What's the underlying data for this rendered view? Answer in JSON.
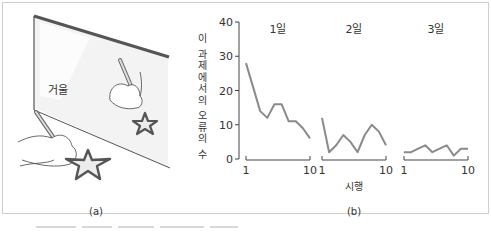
{
  "illustration": {
    "mirror_label": "거울",
    "panel_label": "(a)"
  },
  "chart_data": {
    "type": "line",
    "title": "",
    "ylabel": "이 과제에서의 오류의 수",
    "xlabel": "시행",
    "panel_label": "(b)",
    "ylim": [
      0,
      40
    ],
    "yticks": [
      0,
      10,
      20,
      30,
      40
    ],
    "grid": false,
    "line_color": "#8a8a8a",
    "panels": [
      {
        "name": "1일",
        "x": [
          1,
          2,
          3,
          4,
          5,
          6,
          7,
          8,
          9,
          10
        ],
        "values": [
          28,
          21,
          14,
          12,
          16,
          16,
          11,
          11,
          9,
          6
        ],
        "xticks": [
          "1",
          "10"
        ]
      },
      {
        "name": "2일",
        "x": [
          1,
          2,
          3,
          4,
          5,
          6,
          7,
          8,
          9,
          10
        ],
        "values": [
          12,
          2,
          4,
          7,
          5,
          2,
          7,
          10,
          8,
          4
        ],
        "xticks": [
          "1",
          "10"
        ]
      },
      {
        "name": "3일",
        "x": [
          1,
          2,
          3,
          4,
          5,
          6,
          7,
          8,
          9,
          10
        ],
        "values": [
          2,
          2,
          3,
          4,
          2,
          3,
          4,
          1,
          3,
          3
        ],
        "xticks": [
          "1",
          "10"
        ]
      }
    ]
  }
}
